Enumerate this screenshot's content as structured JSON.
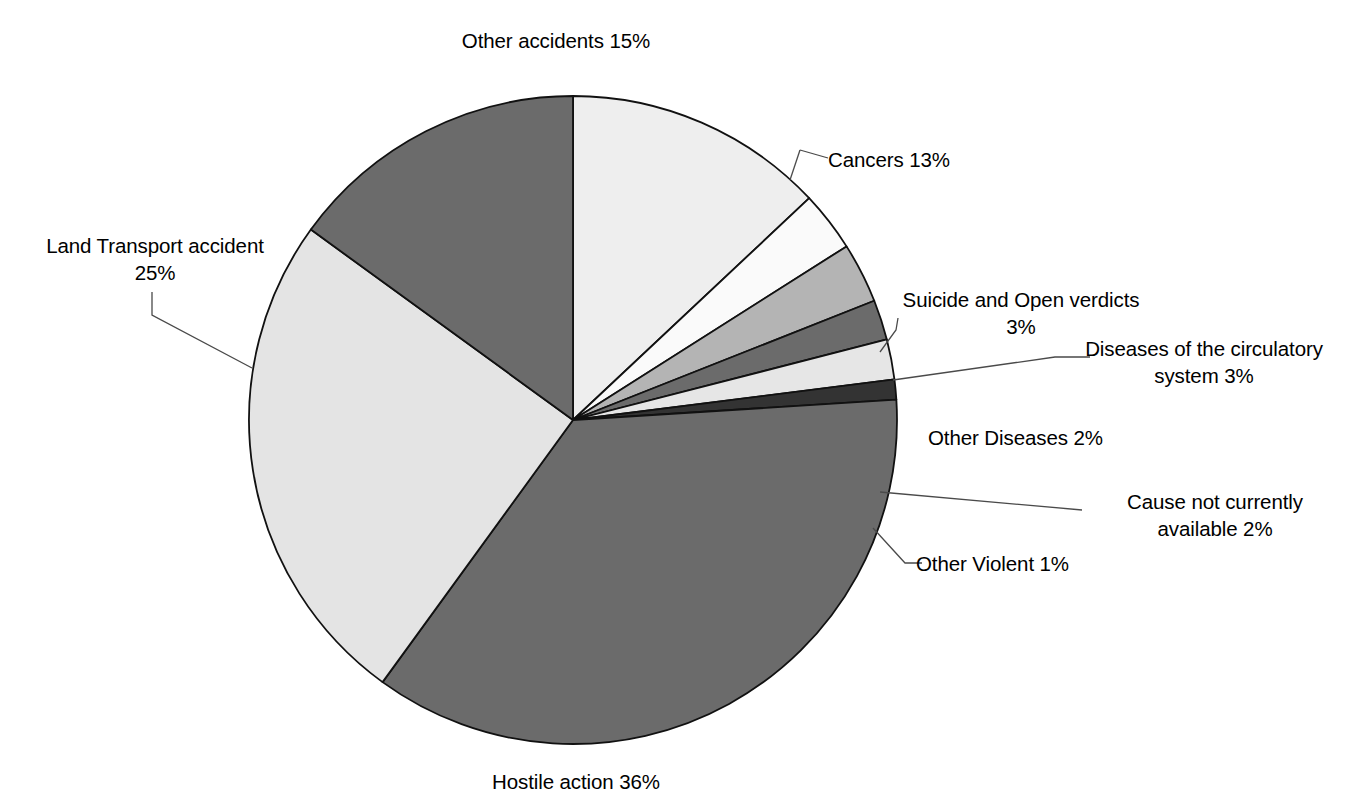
{
  "chart_data": {
    "type": "pie",
    "title": "",
    "xlabel": "",
    "ylabel": "",
    "legend_position": "none",
    "grid": false,
    "start_angle_deg": 0,
    "direction": "clockwise",
    "units": "percent",
    "categories": [
      "Cancers",
      "Suicide and Open verdicts",
      "Diseases of the circulatory system",
      "Other Diseases",
      "Cause not currently available",
      "Other Violent",
      "Hostile action",
      "Land Transport accident",
      "Other accidents"
    ],
    "values": [
      13,
      3,
      3,
      2,
      2,
      1,
      36,
      25,
      15
    ],
    "slices": [
      {
        "label": "Cancers",
        "value": 13,
        "value_text": "13%",
        "label_text": "Cancers 13%",
        "color": "#eeeeee",
        "leader_line": true
      },
      {
        "label": "Suicide and Open verdicts",
        "value": 3,
        "value_text": "3%",
        "label_text": "Suicide and Open verdicts\n3%",
        "color": "#fafafa",
        "leader_line": true
      },
      {
        "label": "Diseases of the circulatory system",
        "value": 3,
        "value_text": "3%",
        "label_text": "Diseases of the circulatory\nsystem 3%",
        "color": "#b4b4b4",
        "leader_line": true
      },
      {
        "label": "Other Diseases",
        "value": 2,
        "value_text": "2%",
        "label_text": "Other Diseases 2%",
        "color": "#6b6b6b",
        "leader_line": false
      },
      {
        "label": "Cause not currently available",
        "value": 2,
        "value_text": "2%",
        "label_text": "Cause not currently\navailable 2%",
        "color": "#e6e6e6",
        "leader_line": true
      },
      {
        "label": "Other Violent",
        "value": 1,
        "value_text": "1%",
        "label_text": "Other Violent 1%",
        "color": "#333333",
        "leader_line": true
      },
      {
        "label": "Hostile action",
        "value": 36,
        "value_text": "36%",
        "label_text": "Hostile action 36%",
        "color": "#6b6b6b",
        "leader_line": false
      },
      {
        "label": "Land Transport accident",
        "value": 25,
        "value_text": "25%",
        "label_text": "Land Transport accident\n25%",
        "color": "#e4e4e4",
        "leader_line": true
      },
      {
        "label": "Other accidents",
        "value": 15,
        "value_text": "15%",
        "label_text": "Other accidents 15%",
        "color": "#6b6b6b",
        "leader_line": false
      }
    ],
    "total_percent": "100%"
  },
  "labels": {
    "other_accidents": "Other accidents 15%",
    "cancers": "Cancers 13%",
    "suicide": "Suicide and Open verdicts\n3%",
    "circulatory": "Diseases of the circulatory\nsystem 3%",
    "other_diseases": "Other Diseases 2%",
    "cause_not_available": "Cause not currently\navailable 2%",
    "other_violent": "Other Violent 1%",
    "land_transport": "Land Transport accident\n25%",
    "hostile_action": "Hostile action 36%"
  },
  "style": {
    "slice_outline": "#111111",
    "leader_line_color": "#4a4a4a",
    "background": "#ffffff",
    "text_color": "#000000"
  },
  "geometry": {
    "center_x": 573,
    "center_y": 420,
    "radius": 324
  }
}
